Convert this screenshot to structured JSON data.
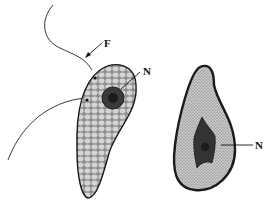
{
  "diagram": {
    "type": "biological-illustration",
    "subjects": [
      {
        "name": "flagellate-cell",
        "description": "Pear-shaped cell with cobblestone granular cytoplasm, dark nucleus, and two flagella",
        "labels": [
          {
            "text": "F",
            "target": "flagellum"
          },
          {
            "text": "N",
            "target": "nucleus"
          }
        ]
      },
      {
        "name": "cyst-form",
        "description": "Teardrop-shaped body with finely stippled cytoplasm, thick dark wall, and irregular dark nucleus",
        "labels": [
          {
            "text": "N",
            "target": "nucleus"
          }
        ]
      }
    ],
    "colors": {
      "outline": "#1a1a1a",
      "cytoplasm": "#b8b8b8",
      "cell_granule": "#d6d6d6",
      "nucleus": "#3a3a3a",
      "nucleus_core": "#1c1c1c",
      "background": "#ffffff"
    }
  }
}
